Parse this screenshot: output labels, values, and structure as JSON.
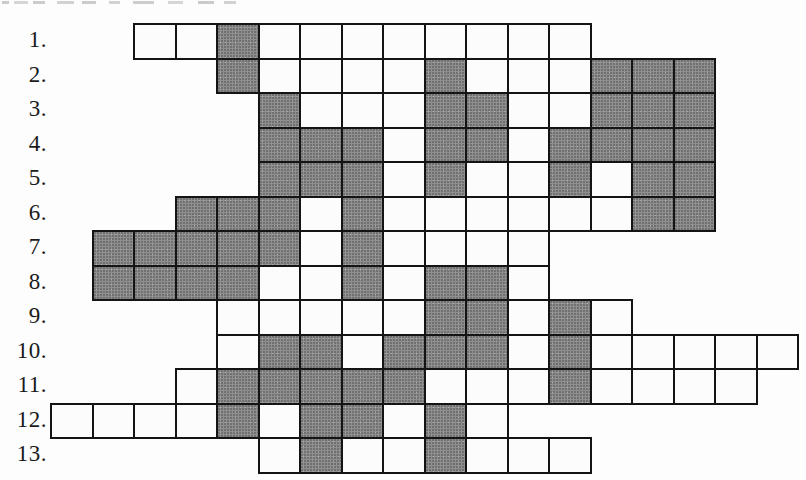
{
  "page": {
    "background": "#fdfdfd"
  },
  "grid": {
    "colors": {
      "shaded_cell": "#8f8f8f",
      "white_cell": "#fcfcfc",
      "border": "#141414"
    },
    "rows": [
      {
        "label": "1.",
        "start_col": 2,
        "cells": [
          "w",
          "w",
          "s",
          "w",
          "w",
          "w",
          "w",
          "w",
          "w",
          "w",
          "w"
        ]
      },
      {
        "label": "2.",
        "start_col": 4,
        "cells": [
          "s",
          "w",
          "w",
          "w",
          "w",
          "s",
          "w",
          "w",
          "w",
          "s",
          "s",
          "s"
        ]
      },
      {
        "label": "3.",
        "start_col": 5,
        "cells": [
          "s",
          "w",
          "w",
          "w",
          "s",
          "s",
          "w",
          "w",
          "s",
          "s",
          "s"
        ]
      },
      {
        "label": "4.",
        "start_col": 5,
        "cells": [
          "s",
          "s",
          "s",
          "w",
          "s",
          "s",
          "w",
          "s",
          "s",
          "s",
          "s"
        ]
      },
      {
        "label": "5.",
        "start_col": 5,
        "cells": [
          "s",
          "s",
          "s",
          "w",
          "s",
          "w",
          "w",
          "s",
          "w",
          "s",
          "s"
        ]
      },
      {
        "label": "6.",
        "start_col": 3,
        "cells": [
          "s",
          "s",
          "s",
          "w",
          "s",
          "w",
          "w",
          "w",
          "w",
          "w",
          "w",
          "s",
          "s"
        ]
      },
      {
        "label": "7.",
        "start_col": 1,
        "cells": [
          "s",
          "s",
          "s",
          "s",
          "s",
          "w",
          "s",
          "w",
          "w",
          "w",
          "w"
        ]
      },
      {
        "label": "8.",
        "start_col": 1,
        "cells": [
          "s",
          "s",
          "s",
          "s",
          "w",
          "w",
          "s",
          "w",
          "s",
          "s",
          "w"
        ]
      },
      {
        "label": "9.",
        "start_col": 4,
        "cells": [
          "w",
          "w",
          "w",
          "w",
          "w",
          "s",
          "s",
          "w",
          "s",
          "w"
        ]
      },
      {
        "label": "10.",
        "start_col": 4,
        "cells": [
          "w",
          "s",
          "s",
          "w",
          "s",
          "s",
          "s",
          "w",
          "s",
          "w",
          "w",
          "w",
          "w",
          "w"
        ]
      },
      {
        "label": "11.",
        "start_col": 3,
        "cells": [
          "w",
          "s",
          "s",
          "s",
          "s",
          "s",
          "w",
          "w",
          "w",
          "s",
          "w",
          "w",
          "w",
          "w"
        ]
      },
      {
        "label": "12.",
        "start_col": 0,
        "cells": [
          "w",
          "w",
          "w",
          "w",
          "s",
          "w",
          "s",
          "s",
          "w",
          "s",
          "w"
        ]
      },
      {
        "label": "13.",
        "start_col": 5,
        "cells": [
          "w",
          "s",
          "w",
          "w",
          "s",
          "w",
          "w",
          "w"
        ]
      }
    ]
  }
}
